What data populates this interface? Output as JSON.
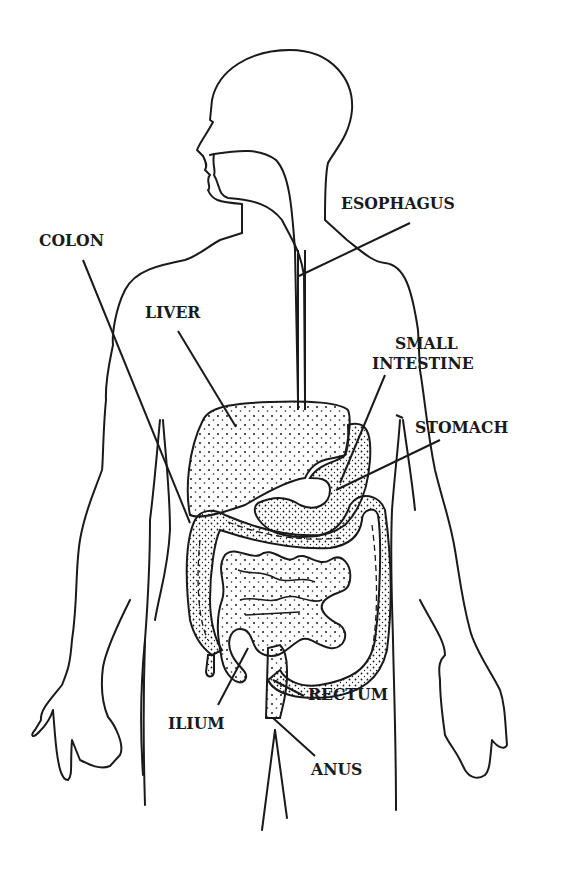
{
  "diagram": {
    "line_color": "#1a1a1a",
    "background": "#ffffff",
    "labels": [
      {
        "id": "esophagus",
        "text": "ESOPHAGUS"
      },
      {
        "id": "colon",
        "text": "COLON"
      },
      {
        "id": "liver",
        "text": "LIVER"
      },
      {
        "id": "small-intestine-line1",
        "text": "SMALL"
      },
      {
        "id": "small-intestine-line2",
        "text": "INTESTINE"
      },
      {
        "id": "stomach",
        "text": "STOMACH"
      },
      {
        "id": "ilium",
        "text": "ILIUM"
      },
      {
        "id": "rectum",
        "text": "RECTUM"
      },
      {
        "id": "anus",
        "text": "ANUS"
      }
    ]
  }
}
